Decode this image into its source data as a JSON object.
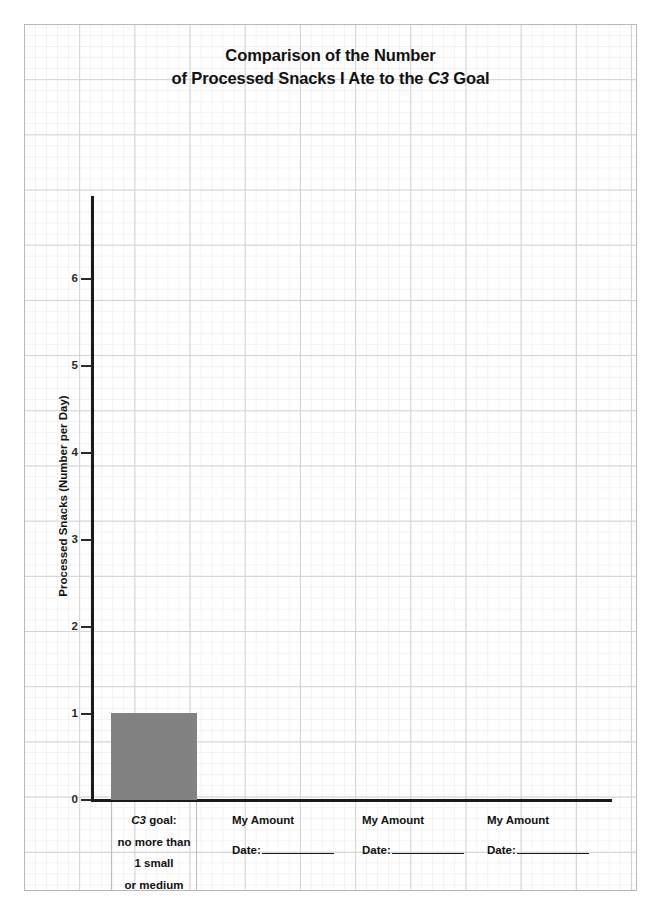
{
  "chart_data": {
    "type": "bar",
    "title": "Comparison of the Number of Processed Snacks I Ate to the C3 Goal",
    "title_line1": "Comparison of the Number",
    "title_line2_prefix": "of ",
    "title_line2_bold": "Processed Snacks",
    "title_line2_mid": " I Ate to the ",
    "title_line2_italic": "C3",
    "title_line2_suffix": " Goal",
    "xlabel": "",
    "ylabel": "Processed Snacks (Number per Day)",
    "ylim": [
      0,
      6.8
    ],
    "yticks": [
      0,
      1,
      2,
      3,
      4,
      5,
      6
    ],
    "ytick_labels": [
      "0",
      "1",
      "2",
      "3",
      "4",
      "5",
      "6"
    ],
    "grid": true,
    "legend": "none",
    "bar_color": "#828282",
    "axis_color": "#1a1a1a",
    "categories": [
      "C3 goal: no more than 1 small or medium",
      "My Amount",
      "My Amount",
      "My Amount"
    ],
    "values": [
      1,
      null,
      null,
      null
    ],
    "series": [
      {
        "name": "Processed Snacks (Number per Day)",
        "values": [
          1,
          null,
          null,
          null
        ]
      }
    ]
  },
  "categories": {
    "goal": {
      "line1_italic": "C3",
      "line1_rest": " goal:",
      "line2": "no more than",
      "line3": "1 small",
      "line4": "or medium"
    },
    "amounts": [
      {
        "title": "My Amount",
        "date_label": "Date:",
        "date_value": ""
      },
      {
        "title": "My Amount",
        "date_label": "Date:",
        "date_value": ""
      },
      {
        "title": "My Amount",
        "date_label": "Date:",
        "date_value": ""
      }
    ]
  },
  "axis": {
    "y_title": "Processed Snacks (Number per Day)",
    "ticks": [
      {
        "value": 6,
        "label": "6"
      },
      {
        "value": 5,
        "label": "5"
      },
      {
        "value": 4,
        "label": "4"
      },
      {
        "value": 3,
        "label": "3"
      },
      {
        "value": 2,
        "label": "2"
      },
      {
        "value": 1,
        "label": "1"
      },
      {
        "value": 0,
        "label": "0"
      }
    ]
  }
}
